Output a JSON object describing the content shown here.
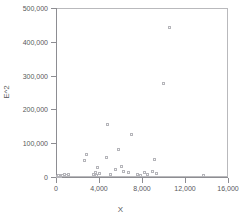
{
  "chart_data": {
    "type": "scatter",
    "title": "",
    "xlabel": "X",
    "ylabel": "E^2",
    "xlim": [
      0,
      16000
    ],
    "ylim": [
      0,
      500000
    ],
    "grid": false,
    "legend": null,
    "xticks": [
      0,
      4000,
      8000,
      12000,
      16000
    ],
    "xtick_labels": [
      "0",
      "4,000",
      "8,000",
      "12,000",
      "16,000"
    ],
    "yticks": [
      0,
      100000,
      200000,
      300000,
      400000,
      500000
    ],
    "ytick_labels": [
      "0",
      "100,000",
      "200,000",
      "300,000",
      "400,000",
      "500,000"
    ],
    "marker": "open-square",
    "marker_color": "#b5b5ba",
    "points": [
      {
        "x": 180,
        "y": 1200
      },
      {
        "x": 320,
        "y": 2600
      },
      {
        "x": 430,
        "y": 900
      },
      {
        "x": 560,
        "y": 3400
      },
      {
        "x": 690,
        "y": 1500
      },
      {
        "x": 820,
        "y": 5200
      },
      {
        "x": 1000,
        "y": 2100
      },
      {
        "x": 1180,
        "y": 6800
      },
      {
        "x": 2700,
        "y": 48000
      },
      {
        "x": 2900,
        "y": 64000
      },
      {
        "x": 3550,
        "y": 6500
      },
      {
        "x": 3700,
        "y": 13000
      },
      {
        "x": 3800,
        "y": 2500
      },
      {
        "x": 3900,
        "y": 27000
      },
      {
        "x": 4050,
        "y": 9000
      },
      {
        "x": 4700,
        "y": 56000
      },
      {
        "x": 4800,
        "y": 154000
      },
      {
        "x": 5100,
        "y": 5000
      },
      {
        "x": 5600,
        "y": 20000
      },
      {
        "x": 5900,
        "y": 81000
      },
      {
        "x": 6100,
        "y": 31000
      },
      {
        "x": 6300,
        "y": 14000
      },
      {
        "x": 6800,
        "y": 12000
      },
      {
        "x": 7100,
        "y": 123000
      },
      {
        "x": 7600,
        "y": 7000
      },
      {
        "x": 7900,
        "y": 2000
      },
      {
        "x": 8300,
        "y": 11000
      },
      {
        "x": 8600,
        "y": 5500
      },
      {
        "x": 9000,
        "y": 16000
      },
      {
        "x": 9200,
        "y": 50000
      },
      {
        "x": 9400,
        "y": 8000
      },
      {
        "x": 10000,
        "y": 274000
      },
      {
        "x": 10600,
        "y": 440000
      },
      {
        "x": 13800,
        "y": 1500
      }
    ]
  }
}
